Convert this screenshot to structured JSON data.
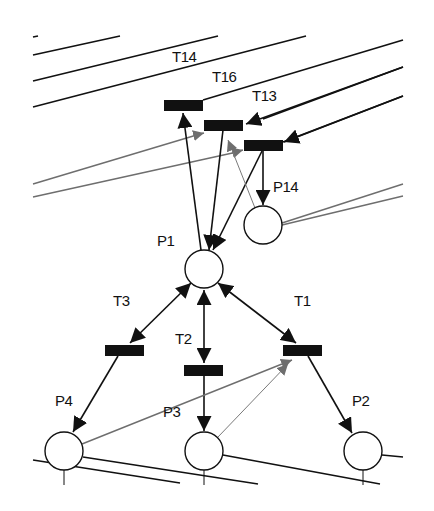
{
  "diagram": {
    "type": "petri-net",
    "colors": {
      "stroke": "#111111",
      "secondary_arc": "#6e6e6e",
      "transition_fill": "#111111",
      "place_fill": "#ffffff"
    },
    "places": [
      {
        "id": "P1",
        "label": "P1",
        "cx": 204,
        "cy": 269
      },
      {
        "id": "P14",
        "label": "P14",
        "cx": 263,
        "cy": 225
      },
      {
        "id": "P4",
        "label": "P4",
        "cx": 64,
        "cy": 451
      },
      {
        "id": "P3",
        "label": "P3",
        "cx": 204,
        "cy": 451
      },
      {
        "id": "P2",
        "label": "P2",
        "cx": 363,
        "cy": 451
      }
    ],
    "transitions": [
      {
        "id": "T14",
        "label": "T14"
      },
      {
        "id": "T16",
        "label": "T16"
      },
      {
        "id": "T13",
        "label": "T13"
      },
      {
        "id": "T3",
        "label": "T3"
      },
      {
        "id": "T2",
        "label": "T2"
      },
      {
        "id": "T1",
        "label": "T1"
      }
    ],
    "arcs": [
      {
        "from": "P1",
        "to": "T14"
      },
      {
        "from": "T16",
        "to": "P1"
      },
      {
        "from": "T13",
        "to": "P1"
      },
      {
        "from": "T13",
        "to": "P14"
      },
      {
        "from": "P14",
        "to": "T16",
        "style": "gray"
      },
      {
        "from": "P1",
        "to": "T3",
        "bidirectional": true
      },
      {
        "from": "P1",
        "to": "T2",
        "bidirectional": true
      },
      {
        "from": "P1",
        "to": "T1",
        "bidirectional": true
      },
      {
        "from": "T3",
        "to": "P4"
      },
      {
        "from": "T2",
        "to": "P3"
      },
      {
        "from": "T1",
        "to": "P2"
      },
      {
        "from": "P4",
        "to": "T1",
        "style": "gray"
      },
      {
        "from": "P3",
        "to": "T1",
        "style": "gray"
      }
    ]
  }
}
